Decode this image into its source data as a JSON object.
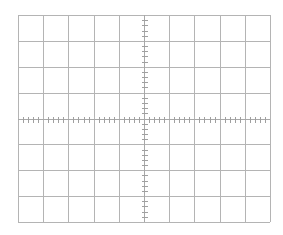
{
  "graticule": {
    "left": 18,
    "top": 15,
    "width": 252,
    "height": 207,
    "divisions_x": 10,
    "divisions_y": 8,
    "minor_ticks_per_division": 5,
    "tick_length": 5,
    "colors": {
      "background": "#ffffff",
      "grid_line": "#b4b4b4",
      "axis_line": "#a8a8a8",
      "tick": "#a0a0a0"
    }
  }
}
